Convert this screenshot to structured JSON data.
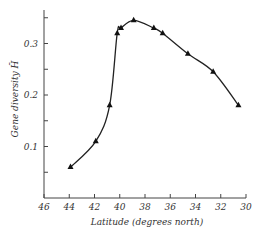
{
  "chart_data": {
    "type": "line",
    "title": "",
    "xlabel": "Latitude (degrees north)",
    "ylabel": "Gene diversity H̄",
    "xlim": [
      46,
      30
    ],
    "ylim": [
      0,
      0.35
    ],
    "x_reversed": true,
    "grid": false,
    "legend": null,
    "x_ticks": [
      "46",
      "44",
      "42",
      "40",
      "38",
      "36",
      "34",
      "32",
      "30"
    ],
    "y_ticks": [
      "0.1",
      "0.2",
      "0.3"
    ],
    "marker": "triangle",
    "series": [
      {
        "name": "Gene diversity",
        "x": [
          43.9,
          41.9,
          40.8,
          40.2,
          39.9,
          38.9,
          37.3,
          36.6,
          34.6,
          32.6,
          30.6
        ],
        "y": [
          0.06,
          0.11,
          0.18,
          0.32,
          0.33,
          0.345,
          0.33,
          0.32,
          0.28,
          0.245,
          0.18
        ]
      }
    ]
  }
}
